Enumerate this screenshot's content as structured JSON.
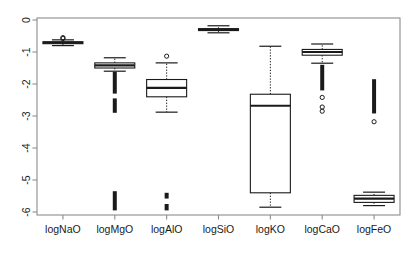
{
  "figure": {
    "kind": "boxplot-figure",
    "background": "#ffffff",
    "frame_color": "#8c8c8c",
    "ink_color": "#1a1a1a"
  },
  "chart_data": {
    "type": "box",
    "title": "",
    "xlabel": "",
    "ylabel": "",
    "ylim": [
      -6,
      0
    ],
    "grid": false,
    "legend": null,
    "y_ticks": [
      "0",
      "-1",
      "-2",
      "-3",
      "-4",
      "-5",
      "-6"
    ],
    "y_tick_values": [
      0,
      -1,
      -2,
      -3,
      -4,
      -5,
      -6
    ],
    "categories": [
      "logNaO",
      "logMgO",
      "logAlO",
      "logSiO",
      "logKO",
      "logCaO",
      "logFeO"
    ],
    "boxes": [
      {
        "label": "logNaO",
        "whisker_low": -0.8,
        "q1": -0.74,
        "median": -0.71,
        "q3": -0.68,
        "whisker_high": -0.62,
        "outliers": [
          -0.55,
          -0.58
        ],
        "outlier_bands": []
      },
      {
        "label": "logMgO",
        "whisker_low": -1.6,
        "q1": -1.5,
        "median": -1.42,
        "q3": -1.34,
        "whisker_high": -1.18,
        "outliers": [],
        "outlier_bands": [
          {
            "from": -2.3,
            "to": -1.62,
            "density": "dense"
          },
          {
            "from": -2.9,
            "to": -2.45,
            "density": "dense"
          },
          {
            "from": -5.95,
            "to": -5.35,
            "density": "dense"
          }
        ]
      },
      {
        "label": "logAlO",
        "whisker_low": -2.88,
        "q1": -2.4,
        "median": -2.12,
        "q3": -1.86,
        "whisker_high": -1.34,
        "outliers": [
          -1.13
        ],
        "outlier_bands": [
          {
            "from": -5.95,
            "to": -5.75,
            "density": "dense"
          },
          {
            "from": -5.58,
            "to": -5.4,
            "density": "dense"
          }
        ]
      },
      {
        "label": "logSiO",
        "whisker_low": -0.4,
        "q1": -0.33,
        "median": -0.3,
        "q3": -0.27,
        "whisker_high": -0.18,
        "outliers": [],
        "outlier_bands": []
      },
      {
        "label": "logKO",
        "whisker_low": -5.85,
        "q1": -5.4,
        "median": -2.68,
        "q3": -2.32,
        "whisker_high": -0.82,
        "outliers": [],
        "outlier_bands": []
      },
      {
        "label": "logCaO",
        "whisker_low": -1.35,
        "q1": -1.1,
        "median": -1.0,
        "q3": -0.92,
        "whisker_high": -0.75,
        "outliers": [
          -2.42,
          -2.72,
          -2.85
        ],
        "outlier_bands": [
          {
            "from": -2.2,
            "to": -1.4,
            "density": "dense"
          }
        ]
      },
      {
        "label": "logFeO",
        "whisker_low": -5.8,
        "q1": -5.7,
        "median": -5.58,
        "q3": -5.48,
        "whisker_high": -5.38,
        "outliers": [
          -3.18
        ],
        "outlier_bands": [
          {
            "from": -2.92,
            "to": -1.85,
            "density": "dense"
          }
        ]
      }
    ]
  }
}
